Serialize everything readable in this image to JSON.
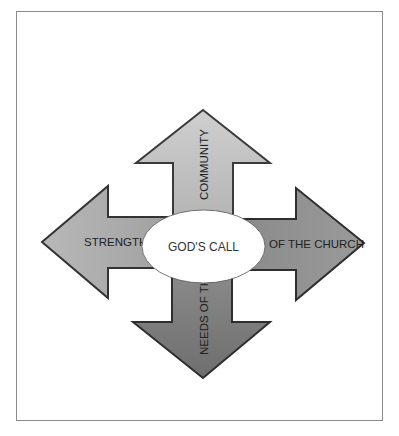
{
  "diagram": {
    "center": {
      "label": "GOD'S CALL"
    },
    "arrows": {
      "up": {
        "label": "COMMUNITY",
        "color": "#c2c2c2"
      },
      "left": {
        "label": "STRENGTHS",
        "color": "#aaaaaa"
      },
      "right": {
        "label": "OF THE CHURCH",
        "color": "#8e8e8e"
      },
      "down": {
        "label": "NEEDS OF THE",
        "color": "#7f7f7f"
      }
    },
    "outline_color": "#3a3a3a",
    "ellipse_fill": "#ffffff"
  }
}
